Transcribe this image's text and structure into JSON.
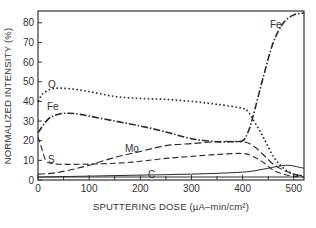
{
  "chart_data": {
    "type": "line",
    "title": "",
    "xlabel": "SPUTTERING DOSE (µA–min/cm²)",
    "ylabel": "NORMALIZED INTENSITY (%)",
    "xlim": [
      0,
      520
    ],
    "ylim": [
      0,
      86
    ],
    "xticks": [
      0,
      100,
      200,
      300,
      400,
      500
    ],
    "xticks_minor": [
      50,
      150,
      250,
      350,
      450
    ],
    "yticks": [
      0,
      10,
      20,
      30,
      40,
      50,
      60,
      70,
      80
    ],
    "grid": false,
    "legend": "inline labels",
    "series": [
      {
        "name": "Fe",
        "style": "dash-dot",
        "label_pos": [
          [
            8,
            36
          ],
          [
            450,
            82
          ]
        ],
        "x": [
          0,
          20,
          40,
          60,
          80,
          100,
          150,
          200,
          250,
          300,
          350,
          380,
          400,
          410,
          420,
          440,
          460,
          480,
          500,
          520
        ],
        "y": [
          24,
          31,
          33.5,
          34,
          33.5,
          32.5,
          30,
          27.5,
          24.5,
          21,
          19.5,
          19.5,
          20,
          24,
          32,
          52,
          70,
          80,
          84,
          85
        ]
      },
      {
        "name": "O",
        "style": "dotted",
        "label_pos": [
          [
            20,
            47
          ]
        ],
        "x": [
          0,
          10,
          30,
          60,
          100,
          150,
          200,
          250,
          300,
          350,
          400,
          410,
          420,
          440,
          460,
          480,
          500,
          520
        ],
        "y": [
          40,
          44,
          46.5,
          46.5,
          45,
          42.5,
          41.5,
          41,
          40,
          38.5,
          36.5,
          35,
          31,
          22,
          12,
          6,
          3,
          2
        ]
      },
      {
        "name": "Mo",
        "style": "long-dash",
        "label_pos": [
          [
            88,
            21
          ]
        ],
        "x": [
          0,
          30,
          60,
          100,
          150,
          200,
          250,
          300,
          350,
          400,
          420,
          440,
          460,
          480,
          500,
          520
        ],
        "y": [
          3,
          3.5,
          5,
          7.5,
          11.5,
          14.5,
          17.5,
          18.5,
          19.5,
          19.5,
          17.5,
          13,
          8,
          5,
          3,
          2
        ]
      },
      {
        "name": "S",
        "style": "dashed",
        "label_pos": [
          [
            12,
            12
          ]
        ],
        "x": [
          0,
          5,
          15,
          25,
          40,
          80,
          150,
          200,
          250,
          300,
          350,
          400,
          420,
          440,
          460,
          480,
          500,
          520
        ],
        "y": [
          22,
          18,
          10,
          8.5,
          8,
          8,
          8.5,
          9.5,
          11,
          12,
          13,
          13.5,
          12,
          9,
          5,
          3,
          2,
          1.5
        ]
      },
      {
        "name": "C",
        "style": "solid",
        "label_pos": [
          [
            218,
            3
          ]
        ],
        "x": [
          0,
          100,
          200,
          300,
          400,
          440,
          470,
          490,
          510,
          520
        ],
        "y": [
          1.5,
          2,
          2.5,
          3,
          4,
          5.5,
          7,
          7.5,
          6.5,
          6
        ]
      }
    ]
  },
  "axes": {
    "x_tick_labels": [
      "0",
      "100",
      "200",
      "300",
      "400",
      "500"
    ],
    "y_tick_labels": [
      "0",
      "10",
      "20",
      "30",
      "40",
      "50",
      "60",
      "70",
      "80"
    ],
    "xlabel": "SPUTTERING DOSE  (µA–min/cm²)",
    "ylabel": "NORMALIZED INTENSITY (%)"
  },
  "labels": {
    "fe_top": "Fe",
    "fe_left": "Fe",
    "o": "O",
    "mo": "Mo",
    "s": "S",
    "c": "C"
  }
}
